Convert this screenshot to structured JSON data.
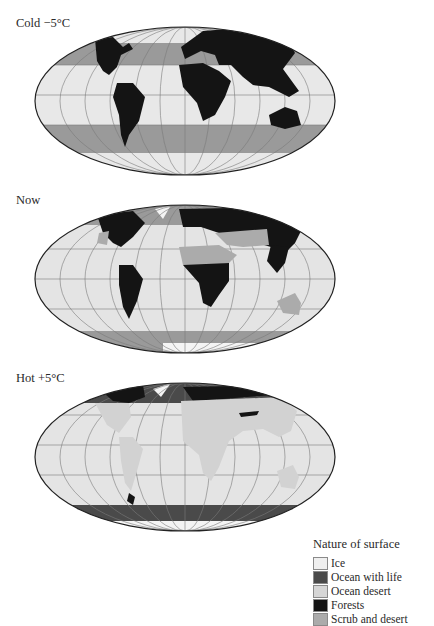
{
  "panels": [
    {
      "label": "Cold −5°C"
    },
    {
      "label": "Now"
    },
    {
      "label": "Hot +5°C"
    }
  ],
  "legend": {
    "title": "Nature of surface",
    "items": [
      {
        "label": "Ice",
        "color": "#efefef"
      },
      {
        "label": "Ocean with life",
        "color": "#4a4a4a"
      },
      {
        "label": "Ocean desert",
        "color": "#d6d6d6"
      },
      {
        "label": "Forests",
        "color": "#141414"
      },
      {
        "label": "Scrub and desert",
        "color": "#ababab"
      }
    ]
  },
  "colors": {
    "ice": "#efefef",
    "ocean_with_life": "#4a4a4a",
    "ocean_desert": "#d6d6d6",
    "forests": "#141414",
    "scrub_and_desert": "#ababab",
    "cold_band": "#9a9a9a",
    "graticule": "#7a7a7a",
    "outline": "#222222"
  }
}
